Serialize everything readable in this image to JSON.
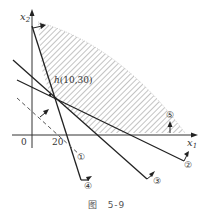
{
  "figure": {
    "caption_prefix": "图",
    "caption_number": "5-9",
    "axes": {
      "x_label": "x",
      "x_sub": "1",
      "y_label": "x",
      "y_sub": "2",
      "origin_label": "0",
      "x_tick": "20"
    },
    "point": {
      "name": "h",
      "coords": "(10,30)"
    },
    "constraints": [
      {
        "id": "1",
        "label": "①",
        "style": "dashed"
      },
      {
        "id": "2",
        "label": "②",
        "style": "solid"
      },
      {
        "id": "3",
        "label": "③",
        "style": "solid"
      },
      {
        "id": "4",
        "label": "④",
        "style": "solid"
      },
      {
        "id": "5",
        "label": "⑤",
        "style": "boundary"
      }
    ],
    "region": "hatched feasible region"
  }
}
